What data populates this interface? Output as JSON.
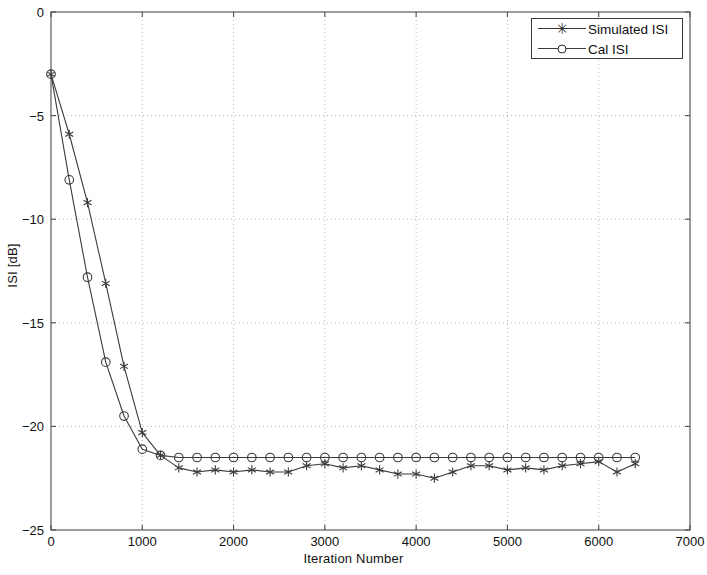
{
  "figure": {
    "background": "#ffffff",
    "axis_color": "#4d4d4d",
    "grid_color": "#b8b8b8",
    "line_color": "#3a3a3a"
  },
  "legend": {
    "position": "top-right-inside",
    "entries": [
      {
        "label": "Simulated ISI",
        "marker": "star-marker",
        "marker_glyph": "✳"
      },
      {
        "label": "Cal ISI",
        "marker": "circle-marker",
        "marker_glyph": "○"
      }
    ]
  },
  "chart_data": {
    "type": "line",
    "title": "",
    "xlabel": "Iteration Number",
    "ylabel": "ISI [dB]",
    "xlim": [
      0,
      7000
    ],
    "ylim": [
      -25,
      0
    ],
    "xticks": [
      0,
      1000,
      2000,
      3000,
      4000,
      5000,
      6000,
      7000
    ],
    "yticks": [
      -25,
      -20,
      -15,
      -10,
      -5,
      0
    ],
    "xtick_labels": [
      "0",
      "1000",
      "2000",
      "3000",
      "4000",
      "5000",
      "6000",
      "7000"
    ],
    "ytick_labels": [
      "−25",
      "−20",
      "−15",
      "−10",
      "−5",
      "0"
    ],
    "grid": true,
    "grid_style": "dotted",
    "legend_position": "upper right",
    "marker_interval": 200,
    "series": [
      {
        "name": "Simulated ISI",
        "marker": "star",
        "color": "#3a3a3a",
        "x": [
          0,
          200,
          400,
          600,
          800,
          1000,
          1200,
          1400,
          1600,
          1800,
          2000,
          2200,
          2400,
          2600,
          2800,
          3000,
          3200,
          3400,
          3600,
          3800,
          4000,
          4200,
          4400,
          4600,
          4800,
          5000,
          5200,
          5400,
          5600,
          5800,
          6000,
          6200,
          6400
        ],
        "values": [
          -3.0,
          -5.9,
          -9.2,
          -13.1,
          -17.1,
          -20.3,
          -21.4,
          -22.0,
          -22.2,
          -22.1,
          -22.2,
          -22.1,
          -22.2,
          -22.2,
          -21.9,
          -21.8,
          -22.0,
          -21.9,
          -22.1,
          -22.3,
          -22.3,
          -22.5,
          -22.2,
          -21.9,
          -21.9,
          -22.1,
          -22.0,
          -22.1,
          -21.9,
          -21.8,
          -21.7,
          -22.2,
          -21.8
        ]
      },
      {
        "name": "Cal ISI",
        "marker": "circle",
        "color": "#3a3a3a",
        "x": [
          0,
          200,
          400,
          600,
          800,
          1000,
          1200,
          1400,
          1600,
          1800,
          2000,
          2200,
          2400,
          2600,
          2800,
          3000,
          3200,
          3400,
          3600,
          3800,
          4000,
          4200,
          4400,
          4600,
          4800,
          5000,
          5200,
          5400,
          5600,
          5800,
          6000,
          6200,
          6400
        ],
        "values": [
          -3.0,
          -8.1,
          -12.8,
          -16.9,
          -19.5,
          -21.1,
          -21.4,
          -21.5,
          -21.5,
          -21.5,
          -21.5,
          -21.5,
          -21.5,
          -21.5,
          -21.5,
          -21.5,
          -21.5,
          -21.5,
          -21.5,
          -21.5,
          -21.5,
          -21.5,
          -21.5,
          -21.5,
          -21.5,
          -21.5,
          -21.5,
          -21.5,
          -21.5,
          -21.5,
          -21.5,
          -21.5,
          -21.5
        ]
      }
    ]
  }
}
